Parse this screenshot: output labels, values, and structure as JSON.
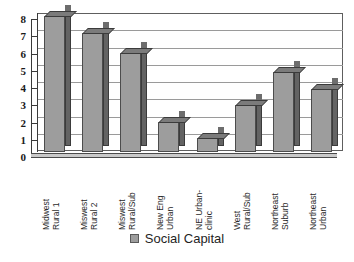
{
  "chart_data": {
    "type": "bar",
    "title": "",
    "subtitle": "",
    "xlabel": "",
    "ylabel": "",
    "ylim": [
      0,
      8
    ],
    "y_ticks": [
      0,
      1,
      2,
      3,
      4,
      5,
      6,
      7,
      8
    ],
    "y_tick_labels": [
      "0",
      "1",
      "2",
      "3",
      "4",
      "5",
      "6",
      "7",
      "8"
    ],
    "grid": true,
    "legend_position": "bottom",
    "style": "3d-column",
    "categories": [
      "Midwest\nRural 1",
      "Miswest\nRural 2",
      "Miswest\nRural/Sub",
      "New Eng\nUrban",
      "NE Urban-\nclinic",
      "West\nRural/Sub",
      "Northeast\nSuburb",
      "Northeast\nUrban"
    ],
    "series": [
      {
        "name": "Social Capital",
        "color": "#9d9d9d",
        "values": [
          7.9,
          6.9,
          5.75,
          1.75,
          0.8,
          2.7,
          4.65,
          3.65
        ]
      }
    ]
  },
  "legend": {
    "items": [
      {
        "label": "Social Capital",
        "color": "#9d9d9d"
      }
    ]
  },
  "colors": {
    "bar_front": "#9d9d9d",
    "bar_side": "#636363",
    "bar_top": "#6d6d6d",
    "gridline": "#9a9a9a",
    "axis": "#3a3a3a",
    "text": "#1a1a1a",
    "background": "#ffffff"
  }
}
